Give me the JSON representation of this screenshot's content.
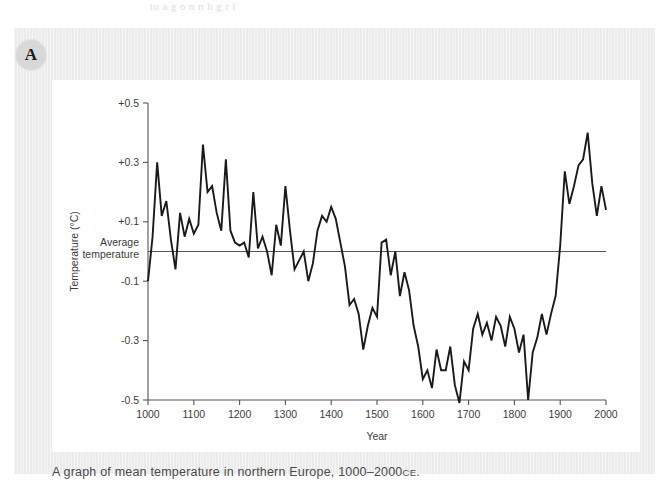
{
  "page": {
    "bleed_text": "to a g    o  n n   h  g  r    i",
    "badge_letter": "A",
    "caption_main": "A graph of mean temperature in northern Europe, 1000–2000",
    "caption_era": "CE",
    "caption_period": ".",
    "colors": {
      "panel_background": "#ebebeb",
      "card_background": "#ffffff",
      "line": "#1a1a1a",
      "axis": "#555555",
      "text": "#3b3b3b",
      "badge": "#d8d8d8"
    }
  },
  "chart_data": {
    "type": "line",
    "title": "",
    "xlabel": "Year",
    "ylabel": "Temperature (°C)",
    "xlim": [
      1000,
      2000
    ],
    "ylim": [
      -0.5,
      0.5
    ],
    "xticks": [
      1000,
      1100,
      1200,
      1300,
      1400,
      1500,
      1600,
      1700,
      1800,
      1900,
      2000
    ],
    "xticklabels": [
      "1000",
      "1100",
      "1200",
      "1300",
      "1400",
      "1500",
      "1600",
      "1700",
      "1800",
      "1900",
      "2000"
    ],
    "yticks": [
      0.5,
      0.3,
      0.1,
      -0.1,
      -0.3,
      -0.5
    ],
    "yticklabels": [
      "+0.5",
      "+0.3",
      "+0.1",
      "-0.1",
      "-0.3",
      "-0.5"
    ],
    "grid": false,
    "legend": null,
    "annotations": [
      {
        "label_line1": "Average",
        "label_line2": "temperature",
        "value": 0.0,
        "type": "horizontal-reference-line"
      }
    ],
    "series": [
      {
        "name": "Mean temperature, northern Europe",
        "color": "#1a1a1a",
        "x": [
          1000,
          1010,
          1020,
          1030,
          1040,
          1050,
          1060,
          1070,
          1080,
          1090,
          1100,
          1110,
          1120,
          1130,
          1140,
          1150,
          1160,
          1170,
          1180,
          1190,
          1200,
          1210,
          1220,
          1230,
          1240,
          1250,
          1260,
          1270,
          1280,
          1290,
          1300,
          1310,
          1320,
          1330,
          1340,
          1350,
          1360,
          1370,
          1380,
          1390,
          1400,
          1410,
          1420,
          1430,
          1440,
          1450,
          1460,
          1470,
          1480,
          1490,
          1500,
          1510,
          1520,
          1530,
          1540,
          1550,
          1560,
          1570,
          1580,
          1590,
          1600,
          1610,
          1620,
          1630,
          1640,
          1650,
          1660,
          1670,
          1680,
          1690,
          1700,
          1710,
          1720,
          1730,
          1740,
          1750,
          1760,
          1770,
          1780,
          1790,
          1800,
          1810,
          1820,
          1830,
          1840,
          1850,
          1860,
          1870,
          1880,
          1890,
          1900,
          1910,
          1920,
          1930,
          1940,
          1950,
          1960,
          1970,
          1980,
          1990,
          2000
        ],
        "y": [
          -0.1,
          0.05,
          0.3,
          0.12,
          0.17,
          0.04,
          -0.06,
          0.13,
          0.05,
          0.11,
          0.06,
          0.09,
          0.36,
          0.2,
          0.22,
          0.13,
          0.07,
          0.31,
          0.07,
          0.03,
          0.02,
          0.03,
          -0.02,
          0.2,
          0.01,
          0.05,
          0.0,
          -0.08,
          0.09,
          0.02,
          0.22,
          0.07,
          -0.06,
          -0.03,
          0.0,
          -0.1,
          -0.04,
          0.07,
          0.12,
          0.1,
          0.15,
          0.11,
          0.03,
          -0.05,
          -0.18,
          -0.16,
          -0.21,
          -0.33,
          -0.25,
          -0.19,
          -0.22,
          0.03,
          0.04,
          -0.08,
          0.0,
          -0.15,
          -0.07,
          -0.13,
          -0.25,
          -0.32,
          -0.43,
          -0.4,
          -0.46,
          -0.33,
          -0.4,
          -0.4,
          -0.32,
          -0.45,
          -0.51,
          -0.37,
          -0.4,
          -0.26,
          -0.21,
          -0.28,
          -0.24,
          -0.3,
          -0.22,
          -0.25,
          -0.32,
          -0.22,
          -0.26,
          -0.34,
          -0.28,
          -0.5,
          -0.34,
          -0.29,
          -0.21,
          -0.28,
          -0.21,
          -0.15,
          0.02,
          0.27,
          0.16,
          0.22,
          0.29,
          0.31,
          0.4,
          0.23,
          0.12,
          0.22,
          0.14
        ]
      }
    ]
  }
}
